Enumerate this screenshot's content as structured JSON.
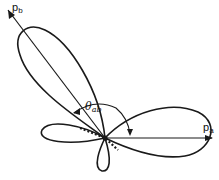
{
  "diagram": {
    "type": "polar-lobe-diagram",
    "vectors": [
      {
        "id": "pa",
        "label_main": "p",
        "label_sub": "a",
        "direction": "horizontal-right"
      },
      {
        "id": "pb",
        "label_main": "p",
        "label_sub": "b",
        "direction": "upper-left"
      }
    ],
    "angle": {
      "label_main": "θ",
      "label_sub": "ab",
      "between": [
        "pa",
        "pb"
      ]
    },
    "lobes": [
      {
        "name": "large lobe along p_b"
      },
      {
        "name": "lobe along p_a"
      },
      {
        "name": "small left lobe"
      },
      {
        "name": "small lower lobe"
      }
    ],
    "colors": {
      "stroke": "#1a1a1a",
      "background": "#ffffff"
    }
  }
}
